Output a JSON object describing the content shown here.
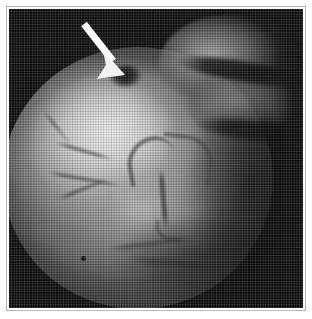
{
  "figure": {
    "type": "halftone-printed grayscale medical photograph",
    "modality": "endoscopic / intraoperative specimen view",
    "caption": "",
    "plate": {
      "page_background": "#ffffff",
      "border_color": "#b9b9b9",
      "photo_background": "#050505",
      "photo_left": 9,
      "photo_top": 9,
      "photo_width": 294,
      "photo_height": 299
    },
    "annotations": [
      {
        "name": "pointer-arrow",
        "shape": "solid straight arrow with triangular head",
        "color": "#ffffff",
        "tail_x": 84,
        "tail_y": 24,
        "tip_x": 122,
        "tip_y": 73,
        "direction": "down-right",
        "points_at": "notch / defect at the superior tissue margin"
      }
    ],
    "regions": [
      {
        "name": "illuminated-circular-field",
        "description": "large round endoscopic light field occupying left and centre"
      },
      {
        "name": "bright-mucosal-dome",
        "description": "brightest convex surface upper-left of centre"
      },
      {
        "name": "upper-right-tissue-fold",
        "description": "separate darker tissue fold across the top right"
      },
      {
        "name": "dark-crease",
        "description": "black crease separating the folds"
      },
      {
        "name": "superior-margin-notch",
        "description": "dark indentation at the top edge indicated by the arrow"
      },
      {
        "name": "branching-vessel",
        "description": "Y-shaped dark vessel at image centre"
      },
      {
        "name": "focal-spot",
        "description": "small dark punctate spot lower left"
      }
    ],
    "colors": {
      "background": "#ffffff",
      "field_black": "#050505",
      "highlight": "#f8f8f5",
      "midtone": "#96968f",
      "arrow": "#ffffff",
      "border": "#b9b9b9"
    }
  }
}
